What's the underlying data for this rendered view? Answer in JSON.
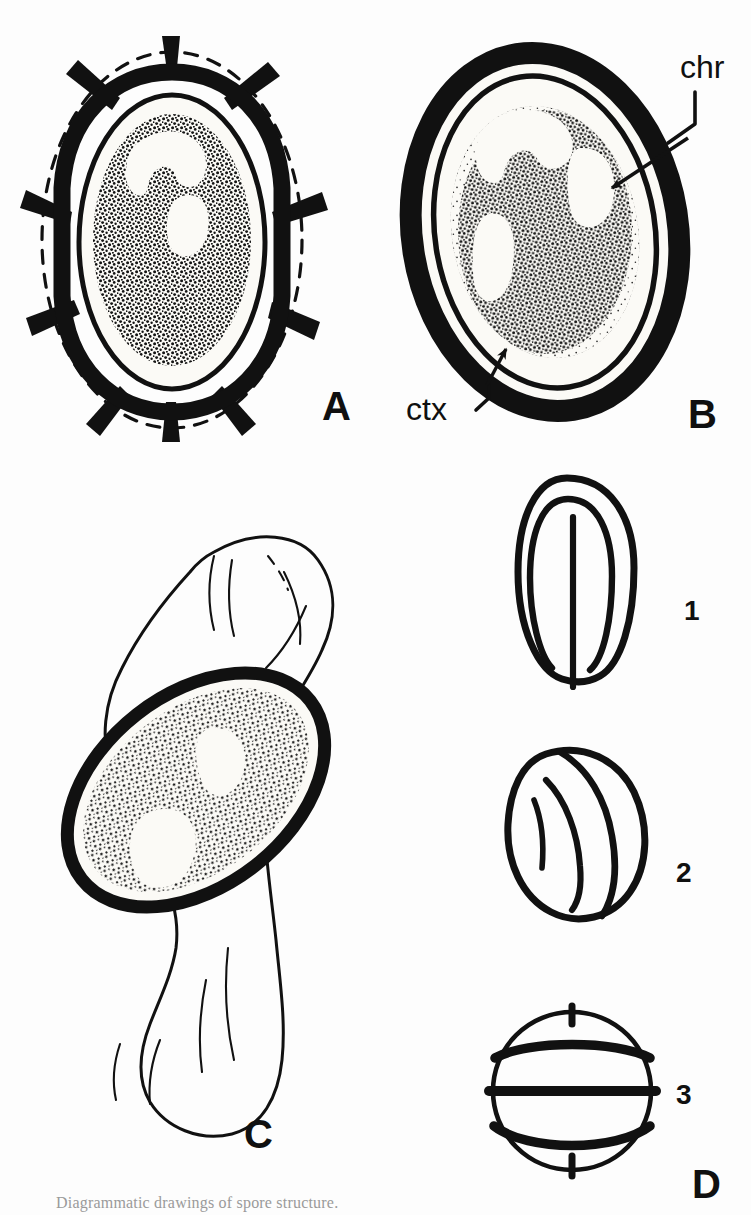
{
  "figure": {
    "background_color": "#fdfdfd",
    "ink_color": "#111111",
    "panels": [
      {
        "id": "A",
        "label": "A",
        "description": "Median section of spore within thickened cell wall showing radiating wall thickenings, dashed outer cell outline, clear cortex and densely stippled core",
        "label_x": 322,
        "label_y": 420
      },
      {
        "id": "B",
        "label": "B",
        "description": "Median section of spore showing thick dark coat, thin inner membrane, clear cortex and dense stippled protoplast with light chromatin lobes",
        "label_x": 700,
        "label_y": 425
      },
      {
        "id": "C",
        "label": "C",
        "description": "Obliquely sectioned spore lying within the collapsed sporangium / mother cell",
        "label_x": 258,
        "label_y": 1142
      },
      {
        "id": "D",
        "label": "D",
        "description": "Outline drawings of whole spores in three orientations",
        "label_x": 704,
        "label_y": 1190
      }
    ],
    "annotations": [
      {
        "id": "chr",
        "text": "chr",
        "meaning": "chromatin",
        "panel": "B",
        "label_x": 686,
        "label_y": 70,
        "arrow_tip_x": 607,
        "arrow_tip_y": 190
      },
      {
        "id": "ctx",
        "text": "ctx",
        "meaning": "cortex",
        "panel": "B",
        "label_x": 438,
        "label_y": 414,
        "arrow_tip_x": 503,
        "arrow_tip_y": 345
      }
    ],
    "orientation_views": [
      {
        "id": "1",
        "label": "1",
        "description": "Proximal / suture view: oval outline with nested U-shaped ridge and central vertical laesura",
        "label_x": 690,
        "label_y": 610
      },
      {
        "id": "2",
        "label": "2",
        "description": "Oblique view: tilted oval with curved lateral ridges",
        "label_x": 685,
        "label_y": 872
      },
      {
        "id": "3",
        "label": "3",
        "description": "Equatorial / distal view: circle with thick equatorial band, two curved arcs and polar tick marks",
        "label_x": 684,
        "label_y": 1108
      }
    ],
    "caption": {
      "visible": "partial",
      "text": "Diagrammatic drawings of spore structure."
    }
  }
}
